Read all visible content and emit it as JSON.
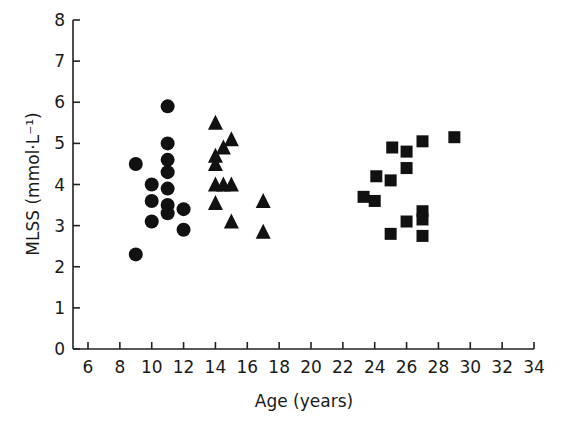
{
  "chart_data": {
    "type": "scatter",
    "title": "",
    "xlabel": "Age (years)",
    "ylabel": "MLSS (mmol·L⁻¹)",
    "xlim": [
      5,
      34
    ],
    "ylim": [
      0,
      8
    ],
    "xticks": [
      6,
      8,
      10,
      12,
      14,
      16,
      18,
      20,
      22,
      24,
      26,
      28,
      30,
      32,
      34
    ],
    "yticks": [
      0,
      1,
      2,
      3,
      4,
      5,
      6,
      7,
      8
    ],
    "grid": false,
    "legend": null,
    "series": [
      {
        "name": "circles",
        "marker": "circle",
        "points": [
          [
            9,
            4.5
          ],
          [
            9,
            2.3
          ],
          [
            10,
            4.0
          ],
          [
            10,
            3.6
          ],
          [
            10,
            3.1
          ],
          [
            11,
            5.9
          ],
          [
            11,
            5.0
          ],
          [
            11,
            4.6
          ],
          [
            11,
            4.3
          ],
          [
            11,
            3.9
          ],
          [
            11,
            3.5
          ],
          [
            11,
            3.3
          ],
          [
            12,
            3.4
          ],
          [
            12,
            2.9
          ]
        ]
      },
      {
        "name": "triangles",
        "marker": "triangle",
        "points": [
          [
            14,
            5.5
          ],
          [
            15,
            5.1
          ],
          [
            14.5,
            4.9
          ],
          [
            14,
            4.7
          ],
          [
            14,
            4.5
          ],
          [
            14,
            4.0
          ],
          [
            14.5,
            4.0
          ],
          [
            15,
            4.0
          ],
          [
            14,
            3.55
          ],
          [
            15,
            3.1
          ],
          [
            17,
            3.6
          ],
          [
            17,
            2.85
          ]
        ]
      },
      {
        "name": "squares",
        "marker": "square",
        "points": [
          [
            23.3,
            3.7
          ],
          [
            24.1,
            4.2
          ],
          [
            24,
            3.6
          ],
          [
            25.1,
            4.9
          ],
          [
            25,
            4.1
          ],
          [
            25,
            2.8
          ],
          [
            26,
            4.8
          ],
          [
            26,
            4.4
          ],
          [
            26,
            3.1
          ],
          [
            27,
            5.05
          ],
          [
            27,
            3.35
          ],
          [
            27,
            3.15
          ],
          [
            27,
            2.75
          ],
          [
            29,
            5.15
          ]
        ]
      }
    ]
  }
}
